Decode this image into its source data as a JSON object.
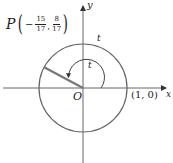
{
  "diagram": {
    "type": "unit-circle",
    "axes": {
      "x_label": "x",
      "y_label": "y",
      "origin_label": "O"
    },
    "point_P": {
      "name": "P",
      "x": {
        "sign": "−",
        "numerator": "15",
        "denominator": "17"
      },
      "y": {
        "numerator": "8",
        "denominator": "17"
      },
      "separator": ","
    },
    "arc_label_outer": "t",
    "angle_label": "t",
    "point_on_x_axis": "(1, 0)",
    "colors": {
      "circle": "#666666",
      "axes": "#555555",
      "radius": "#777777",
      "text": "#222222"
    }
  }
}
